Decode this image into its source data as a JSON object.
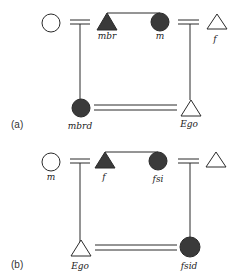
{
  "panels": [
    {
      "id": "a",
      "panel_label": "(a)",
      "nodes": {
        "n1": {
          "shape": "circle",
          "filled": false,
          "label": ""
        },
        "n2": {
          "shape": "triangle",
          "filled": true,
          "label": "mbr"
        },
        "n3": {
          "shape": "circle",
          "filled": true,
          "label": "m"
        },
        "n4": {
          "shape": "triangle",
          "filled": false,
          "label": "f"
        },
        "n5": {
          "shape": "circle",
          "filled": true,
          "label": "mbrd"
        },
        "n6": {
          "shape": "triangle",
          "filled": false,
          "label": "Ego"
        }
      }
    },
    {
      "id": "b",
      "panel_label": "(b)",
      "nodes": {
        "n1": {
          "shape": "circle",
          "filled": false,
          "label": "m"
        },
        "n2": {
          "shape": "triangle",
          "filled": true,
          "label": "f"
        },
        "n3": {
          "shape": "circle",
          "filled": true,
          "label": "fsi"
        },
        "n4": {
          "shape": "triangle",
          "filled": false,
          "label": ""
        },
        "n5": {
          "shape": "triangle",
          "filled": false,
          "label": "Ego"
        },
        "n6": {
          "shape": "circle",
          "filled": true,
          "label": "fsid"
        }
      }
    }
  ],
  "colors": {
    "fill": "#3a3a3a",
    "stroke": "#2a2a2a",
    "background": "#ffffff"
  }
}
